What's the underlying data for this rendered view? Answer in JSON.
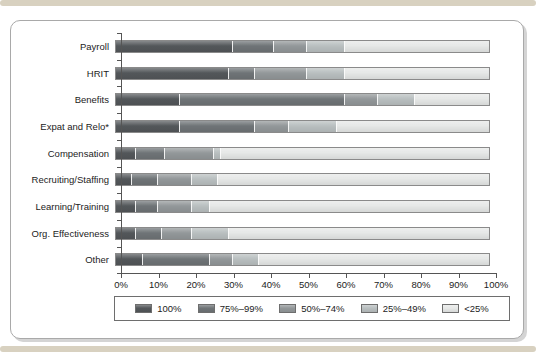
{
  "page": {
    "decor_color": "#d8d1c0"
  },
  "chart_data": {
    "type": "bar",
    "orientation": "horizontal",
    "stacked": true,
    "title": "",
    "xlabel": "",
    "ylabel": "",
    "categories": [
      "Payroll",
      "HRIT",
      "Benefits",
      "Expat and Relo*",
      "Compensation",
      "Recruiting/Staffing",
      "Learning/Training",
      "Org. Effectiveness",
      "Other"
    ],
    "series": [
      {
        "name": "100%",
        "color": "#53575a",
        "values": [
          31,
          30,
          17,
          17,
          5,
          4,
          5,
          5,
          7
        ]
      },
      {
        "name": "75%–99%",
        "color": "#6f7477",
        "values": [
          11,
          7,
          44,
          20,
          8,
          7,
          6,
          7,
          18
        ]
      },
      {
        "name": "50%–74%",
        "color": "#93989a",
        "values": [
          9,
          14,
          9,
          9,
          13,
          9,
          9,
          8,
          6
        ]
      },
      {
        "name": "25%–49%",
        "color": "#b9bfc0",
        "values": [
          10,
          10,
          10,
          13,
          2,
          7,
          5,
          10,
          7
        ]
      },
      {
        "name": "<25%",
        "color": "#e6e8e7",
        "values": [
          39,
          39,
          20,
          41,
          72,
          73,
          75,
          70,
          62
        ]
      }
    ],
    "x_axis": {
      "min": 0,
      "max": 100,
      "ticks": [
        "0%",
        "10%",
        "20%",
        "30%",
        "40%",
        "50%",
        "60%",
        "70%",
        "80%",
        "90%",
        "100%"
      ]
    },
    "legend": {
      "position": "bottom",
      "items": [
        "100%",
        "75%–99%",
        "50%–74%",
        "25%–49%",
        "<25%"
      ]
    }
  }
}
